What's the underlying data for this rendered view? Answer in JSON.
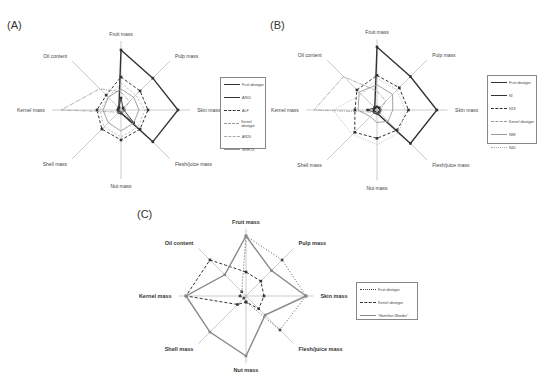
{
  "panels": {
    "A": {
      "label": "(A)"
    },
    "B": {
      "label": "(B)"
    },
    "C": {
      "label": "(C)"
    }
  },
  "axes": [
    "Fruit mass",
    "Pulp mass",
    "Skin mass",
    "Flesh/juice mass",
    "Nut mass",
    "Shell mass",
    "Kernel mass",
    "Oil content"
  ],
  "chart_data": [
    {
      "type": "radar",
      "title": "(A)",
      "categories": [
        "Fruit mass",
        "Pulp mass",
        "Skin mass",
        "Flesh/juice mass",
        "Nut mass",
        "Shell mass",
        "Kernel mass",
        "Oil content"
      ],
      "rlim": [
        0,
        1
      ],
      "legend_position": "right",
      "series": [
        {
          "name": "Fruit ideotype",
          "style": "solid-thick",
          "color": "#333333",
          "values": [
            1.0,
            0.75,
            0.95,
            0.75,
            0.05,
            0.05,
            0.05,
            0.05
          ]
        },
        {
          "name": "AR01",
          "style": "solid-marker",
          "color": "#333333",
          "values": [
            0.2,
            0.05,
            0.05,
            0.3,
            0.05,
            0.05,
            0.05,
            0.05
          ]
        },
        {
          "name": "ALF",
          "style": "dashed-marker",
          "color": "#444444",
          "values": [
            0.55,
            0.45,
            0.45,
            0.45,
            0.5,
            0.45,
            0.4,
            0.35
          ]
        },
        {
          "name": "Kernel ideotype",
          "style": "dash-dot",
          "color": "#999999",
          "values": [
            0.3,
            0.2,
            0.05,
            0.05,
            0.05,
            0.05,
            1.0,
            0.5
          ]
        },
        {
          "name": "AR20",
          "style": "dashed-light",
          "color": "#aaaaaa",
          "values": [
            0.45,
            0.35,
            0.4,
            0.4,
            0.45,
            0.4,
            0.35,
            0.3
          ]
        },
        {
          "name": "WRF23",
          "style": "solid-light",
          "color": "#999999",
          "values": [
            0.35,
            0.3,
            0.3,
            0.3,
            0.35,
            0.3,
            0.3,
            0.3
          ]
        }
      ]
    },
    {
      "type": "radar",
      "title": "(B)",
      "categories": [
        "Fruit mass",
        "Pulp mass",
        "Skin mass",
        "Flesh/juice mass",
        "Nut mass",
        "Shell mass",
        "Kernel mass",
        "Oil content"
      ],
      "rlim": [
        0,
        1
      ],
      "legend_position": "right",
      "series": [
        {
          "name": "Fruit ideotype",
          "style": "solid-thick",
          "color": "#333333",
          "values": [
            1.0,
            0.75,
            0.95,
            0.75,
            0.05,
            0.05,
            0.05,
            0.05
          ]
        },
        {
          "name": "NI",
          "style": "solid-marker",
          "color": "#333333",
          "values": [
            0.05,
            0.05,
            0.05,
            0.05,
            0.05,
            0.05,
            0.15,
            0.05
          ]
        },
        {
          "name": "N18",
          "style": "dashed-marker",
          "color": "#444444",
          "values": [
            0.55,
            0.5,
            0.5,
            0.45,
            0.45,
            0.5,
            0.35,
            0.45
          ]
        },
        {
          "name": "Kernel ideotype",
          "style": "dash-dot",
          "color": "#999999",
          "values": [
            0.3,
            0.2,
            0.05,
            0.05,
            0.05,
            0.05,
            1.0,
            0.75
          ]
        },
        {
          "name": "N88",
          "style": "solid-light",
          "color": "#999999",
          "values": [
            0.4,
            0.35,
            0.25,
            0.25,
            0.2,
            0.15,
            0.3,
            0.4
          ]
        },
        {
          "name": "N40",
          "style": "dotted-light",
          "color": "#aaaaaa",
          "values": [
            0.5,
            0.45,
            0.45,
            0.5,
            0.55,
            0.55,
            0.7,
            0.35
          ]
        }
      ]
    },
    {
      "type": "radar",
      "title": "(C)",
      "categories": [
        "Fruit mass",
        "Pulp mass",
        "Skin mass",
        "Flesh/juice mass",
        "Nut mass",
        "Shell mass",
        "Kernel mass",
        "Oil content"
      ],
      "rlim": [
        0,
        1
      ],
      "legend_position": "right",
      "series": [
        {
          "name": "Fruit ideotype",
          "style": "dotted-marker",
          "color": "#444444",
          "values": [
            1.0,
            0.85,
            1.0,
            0.8,
            0.1,
            0.05,
            0.1,
            0.1
          ]
        },
        {
          "name": "Kernel ideotype",
          "style": "dashed-marker",
          "color": "#333333",
          "values": [
            0.4,
            0.35,
            0.3,
            0.3,
            0.1,
            0.2,
            1.0,
            0.85
          ]
        },
        {
          "name": "\"Hamilton Wonder\"",
          "style": "solid-thick-grey",
          "color": "#888888",
          "values": [
            1.0,
            0.6,
            1.0,
            0.45,
            1.0,
            0.85,
            1.0,
            0.5
          ]
        }
      ]
    }
  ],
  "legends": {
    "A": [
      "Fruit ideotype",
      "AR01",
      "ALF",
      "Kernel ideotype",
      "AR20",
      "WRF23"
    ],
    "B": [
      "Fruit ideotype",
      "NI",
      "N18",
      "Kernel ideotype",
      "N88",
      "N40"
    ],
    "C": [
      "Fruit ideotype",
      "Kernel ideotype",
      "\"Hamilton Wonder\""
    ]
  }
}
